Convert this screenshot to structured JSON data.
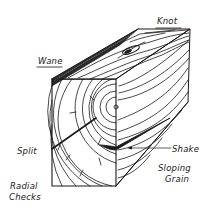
{
  "diagram": {
    "ink_color": "#1a1a1a",
    "background": "#ffffff",
    "labels": {
      "knot": "Knot",
      "wane": "Wane",
      "split": "Split",
      "shake": "Shake",
      "sloping_grain_line1": "Sloping",
      "sloping_grain_line2": "Grain",
      "radial_checks_line1": "Radial",
      "radial_checks_line2": "Checks"
    }
  }
}
